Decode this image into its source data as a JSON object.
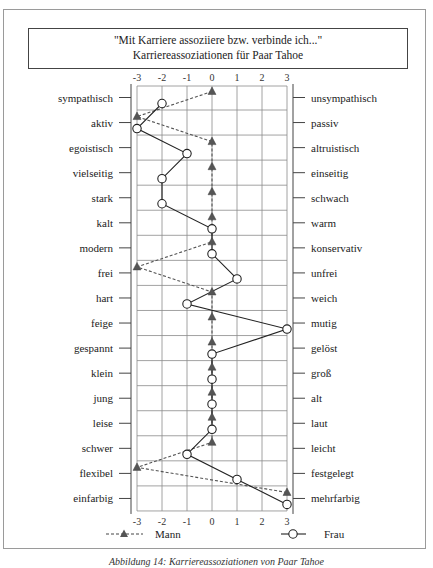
{
  "title": {
    "line1": "\"Mit Karriere assoziiere bzw. verbinde ich...\"",
    "line2": "Karriereassoziationen für Paar Tahoe"
  },
  "legend": {
    "mann": "Mann",
    "frau": "Frau"
  },
  "caption": "Abbildung 14: Karriereassoziationen von Paar Tahoe",
  "chart_data": {
    "type": "line",
    "title": "\"Mit Karriere assoziiere bzw. verbinde ich...\" Karriereassoziationen für Paar Tahoe",
    "orientation": "horizontal semantic differential",
    "xlim": [
      -3,
      3
    ],
    "x_ticks": [
      -3,
      -2,
      -1,
      0,
      1,
      2,
      3
    ],
    "grid": true,
    "legend_position": "bottom",
    "left_labels": [
      "sympathisch",
      "aktiv",
      "egoistisch",
      "vielseitig",
      "stark",
      "kalt",
      "modern",
      "frei",
      "hart",
      "feige",
      "gespannt",
      "klein",
      "jung",
      "leise",
      "schwer",
      "flexibel",
      "einfarbig"
    ],
    "right_labels": [
      "unsympathisch",
      "passiv",
      "altruistisch",
      "einseitig",
      "schwach",
      "warm",
      "konservativ",
      "unfrei",
      "weich",
      "mutig",
      "gelöst",
      "groß",
      "alt",
      "laut",
      "leicht",
      "festgelegt",
      "mehrfarbig"
    ],
    "series": [
      {
        "name": "Mann",
        "marker": "triangle",
        "line": "dashed",
        "color": "#555555",
        "values": [
          0,
          -3,
          0,
          0,
          0,
          0,
          0,
          -3,
          0,
          0,
          0,
          0,
          0,
          0,
          0,
          -3,
          3
        ]
      },
      {
        "name": "Frau",
        "marker": "circle-open",
        "line": "solid",
        "color": "#222222",
        "values": [
          -2,
          -3,
          -1,
          -2,
          -2,
          0,
          0,
          1,
          -1,
          3,
          0,
          0,
          0,
          0,
          -1,
          1,
          3
        ]
      }
    ]
  }
}
